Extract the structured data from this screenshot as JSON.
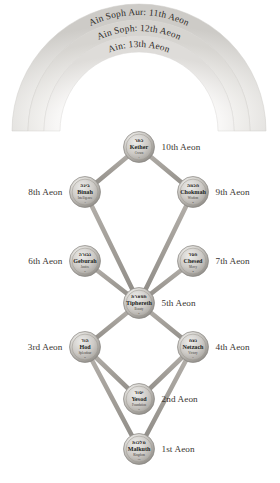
{
  "diagram": {
    "background": "#ffffff",
    "node_fill_light": "#e9e7e4",
    "node_fill_mid": "#b9b6b1",
    "node_fill_dark": "#8e8b86",
    "path_color": "#a6a29c",
    "veil_color_outer": "#d8d6d3",
    "veil_color_mid": "#e2e0dd",
    "veil_color_inner": "#eceae8",
    "text_color": "#2e2b28"
  },
  "veils": [
    {
      "id": "ain",
      "label": "Ain: 13th Aeon",
      "aeon": 13
    },
    {
      "id": "ain-soph",
      "label": "Ain Soph: 12th Aeon",
      "aeon": 12
    },
    {
      "id": "ain-soph-aur",
      "label": "Ain Soph Aur: 11th Aeon",
      "aeon": 11
    }
  ],
  "sephirot": [
    {
      "id": "kether",
      "hebrew": "כתר",
      "name": "Kether",
      "attribute": "Crown",
      "number": "1",
      "aeon_label": "10th Aeon",
      "aeon_side": "right",
      "cx": 139,
      "cy": 147
    },
    {
      "id": "chokmah",
      "hebrew": "חכמה",
      "name": "Chokmah",
      "attribute": "Wisdom",
      "number": "2",
      "aeon_label": "9th Aeon",
      "aeon_side": "right",
      "cx": 193,
      "cy": 192
    },
    {
      "id": "binah",
      "hebrew": "בינה",
      "name": "Binah",
      "attribute": "Intelligence",
      "number": "3",
      "aeon_label": "8th Aeon",
      "aeon_side": "left",
      "cx": 85,
      "cy": 192
    },
    {
      "id": "chesed",
      "hebrew": "חסד",
      "name": "Chesed",
      "attribute": "Mercy",
      "number": "4",
      "aeon_label": "7th Aeon",
      "aeon_side": "right",
      "cx": 193,
      "cy": 261
    },
    {
      "id": "geburah",
      "hebrew": "גבורה",
      "name": "Geburah",
      "attribute": "Justice",
      "number": "5",
      "aeon_label": "6th Aeon",
      "aeon_side": "left",
      "cx": 85,
      "cy": 261
    },
    {
      "id": "tiphereth",
      "hebrew": "תפארת",
      "name": "Tiphereth",
      "attribute": "Beauty",
      "number": "6",
      "aeon_label": "5th Aeon",
      "aeon_side": "right",
      "cx": 139,
      "cy": 303
    },
    {
      "id": "netzach",
      "hebrew": "נצח",
      "name": "Netzach",
      "attribute": "Victory",
      "number": "7",
      "aeon_label": "4th Aeon",
      "aeon_side": "right",
      "cx": 193,
      "cy": 347
    },
    {
      "id": "hod",
      "hebrew": "הוד",
      "name": "Hod",
      "attribute": "Splendour",
      "number": "8",
      "aeon_label": "3rd Aeon",
      "aeon_side": "left",
      "cx": 85,
      "cy": 347
    },
    {
      "id": "yesod",
      "hebrew": "יסוד",
      "name": "Yesod",
      "attribute": "Foundation",
      "number": "9",
      "aeon_label": "2nd Aeon",
      "aeon_side": "right",
      "cx": 139,
      "cy": 399
    },
    {
      "id": "malkuth",
      "hebrew": "מלכות",
      "name": "Malkuth",
      "attribute": "Kingdom",
      "number": "10",
      "aeon_label": "1st Aeon",
      "aeon_side": "right",
      "cx": 139,
      "cy": 449
    }
  ],
  "paths": [
    {
      "from": "kether",
      "to": "chokmah"
    },
    {
      "from": "kether",
      "to": "binah"
    },
    {
      "from": "kether",
      "to": "tiphereth"
    },
    {
      "from": "chokmah",
      "to": "binah"
    },
    {
      "from": "chokmah",
      "to": "chesed"
    },
    {
      "from": "chokmah",
      "to": "tiphereth"
    },
    {
      "from": "binah",
      "to": "geburah"
    },
    {
      "from": "binah",
      "to": "tiphereth"
    },
    {
      "from": "chesed",
      "to": "geburah"
    },
    {
      "from": "chesed",
      "to": "tiphereth"
    },
    {
      "from": "chesed",
      "to": "netzach"
    },
    {
      "from": "geburah",
      "to": "tiphereth"
    },
    {
      "from": "geburah",
      "to": "hod"
    },
    {
      "from": "tiphereth",
      "to": "netzach"
    },
    {
      "from": "tiphereth",
      "to": "hod"
    },
    {
      "from": "tiphereth",
      "to": "yesod"
    },
    {
      "from": "netzach",
      "to": "hod"
    },
    {
      "from": "netzach",
      "to": "yesod"
    },
    {
      "from": "netzach",
      "to": "malkuth"
    },
    {
      "from": "hod",
      "to": "yesod"
    },
    {
      "from": "hod",
      "to": "malkuth"
    },
    {
      "from": "yesod",
      "to": "malkuth"
    }
  ]
}
